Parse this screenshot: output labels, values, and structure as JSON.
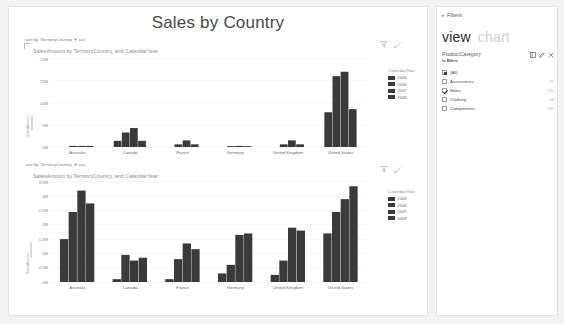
{
  "report": {
    "title": "Sales by Country"
  },
  "visuals": [
    {
      "sort_prefix": "sort by",
      "sort_field": "TerritoryCountry",
      "sort_caret": "▼",
      "sort_dir": "asc",
      "title": "SalesAmount by TerritoryCountry, and CalendarYear",
      "filter_icon": "filter-funnel-icon",
      "focus_icon": "focus-mode-icon",
      "y_axis_name": "SalesAmount",
      "legend": {
        "title": "CalendarYear",
        "items": [
          "2005",
          "2006",
          "2007",
          "2008"
        ]
      }
    },
    {
      "sort_prefix": "sort by",
      "sort_field": "TerritoryCountry",
      "sort_caret": "▼",
      "sort_dir": "asc",
      "title": "SalesAmount by TerritoryCountry, and CalendarYear",
      "filter_icon": "filter-funnel-icon",
      "focus_icon": "focus-mode-icon",
      "y_axis_name": "SalesAmount",
      "legend": {
        "title": "CalendarYear",
        "items": [
          "2005",
          "2006",
          "2007",
          "2008"
        ]
      }
    }
  ],
  "panel": {
    "filters_label": "Filters",
    "filters_chevron": "▸",
    "tabs": [
      {
        "label": "view",
        "active": true
      },
      {
        "label": "chart",
        "active": false
      }
    ],
    "filter_card": {
      "field": "ProductCategory",
      "condition": "is Bikes",
      "icons": [
        "list-view-icon",
        "edit-pencil-icon",
        "close-x-icon"
      ],
      "items": [
        {
          "label": "(All)",
          "count": "",
          "state": "partial"
        },
        {
          "label": "Accessories",
          "count": "35",
          "state": "off"
        },
        {
          "label": "Bikes",
          "count": "125",
          "state": "checked"
        },
        {
          "label": "Clothing",
          "count": "48",
          "state": "off"
        },
        {
          "label": "Components",
          "count": "189",
          "state": "off"
        }
      ]
    }
  },
  "colors": {
    "bar": "#3a3a3a",
    "grid": "#ededed",
    "axis_text": "#8a8a8a",
    "canvas": "#ffffff",
    "background": "#f2f2f2"
  },
  "chart_data": [
    {
      "type": "bar",
      "title": "SalesAmount by TerritoryCountry, and CalendarYear",
      "xlabel": "",
      "ylabel": "SalesAmount",
      "categories": [
        "Australia",
        "Canada",
        "France",
        "Germany",
        "United Kingdom",
        "United States"
      ],
      "legend_title": "CalendarYear",
      "legend_position": "right",
      "grid": true,
      "ylim": [
        0,
        20000000
      ],
      "yticks": [
        "0M",
        "5M",
        "10M",
        "15M",
        "20M"
      ],
      "ytick_values": [
        0,
        5000000,
        10000000,
        15000000,
        20000000
      ],
      "series": [
        {
          "name": "2005",
          "values": [
            0,
            1400000,
            0,
            0,
            0,
            7900000
          ]
        },
        {
          "name": "2006",
          "values": [
            250000,
            3300000,
            600000,
            200000,
            600000,
            16100000
          ]
        },
        {
          "name": "2007",
          "values": [
            250000,
            4300000,
            1500000,
            250000,
            1500000,
            17100000
          ]
        },
        {
          "name": "2008",
          "values": [
            250000,
            1400000,
            600000,
            200000,
            600000,
            8600000
          ]
        }
      ]
    },
    {
      "type": "bar",
      "title": "SalesAmount by TerritoryCountry, and CalendarYear",
      "xlabel": "",
      "ylabel": "SalesAmount",
      "categories": [
        "Australia",
        "Canada",
        "France",
        "Germany",
        "United Kingdom",
        "United States"
      ],
      "legend_title": "CalendarYear",
      "legend_position": "right",
      "grid": true,
      "ylim": [
        0,
        3500000
      ],
      "yticks": [
        "0M",
        "0.5M",
        "1M",
        "1.5M",
        "2M",
        "2.5M",
        "3M",
        "3.5M"
      ],
      "ytick_values": [
        0,
        500000,
        1000000,
        1500000,
        2000000,
        2500000,
        3000000,
        3500000
      ],
      "series": [
        {
          "name": "2005",
          "values": [
            1500000,
            100000,
            100000,
            300000,
            250000,
            1700000
          ]
        },
        {
          "name": "2006",
          "values": [
            2450000,
            950000,
            800000,
            600000,
            750000,
            2450000
          ]
        },
        {
          "name": "2007",
          "values": [
            3200000,
            750000,
            1350000,
            1650000,
            1900000,
            2900000
          ]
        },
        {
          "name": "2008",
          "values": [
            2750000,
            850000,
            1150000,
            1700000,
            1800000,
            3350000
          ]
        }
      ]
    }
  ]
}
